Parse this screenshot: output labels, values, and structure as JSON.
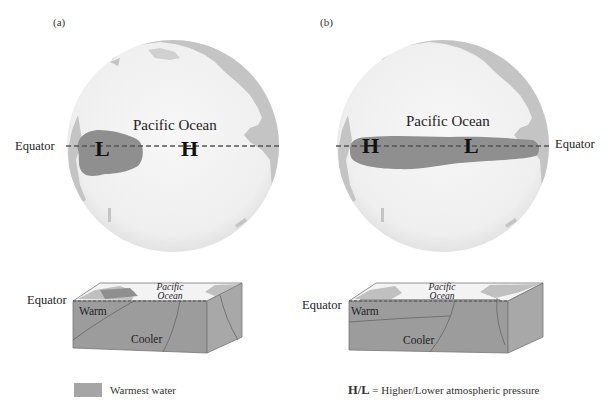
{
  "figure": {
    "panels": [
      {
        "id": "a",
        "label": "(a)",
        "globe": {
          "ocean_label": "Pacific Ocean",
          "equator_label": "Equator",
          "low_label": "L",
          "high_label": "H",
          "warm_pool_position": "western Pacific"
        },
        "block": {
          "equator_label": "Equator",
          "ocean_label_line1": "Pacific",
          "ocean_label_line2": "Ocean",
          "warm_label": "Warm",
          "cool_label": "Cooler"
        }
      },
      {
        "id": "b",
        "label": "(b)",
        "globe": {
          "ocean_label": "Pacific Ocean",
          "equator_label": "Equator",
          "high_label": "H",
          "low_label": "L",
          "warm_pool_position": "spread across equatorial Pacific"
        },
        "block": {
          "equator_label": "Equator",
          "ocean_label_line1": "Pacific",
          "ocean_label_line2": "Ocean",
          "warm_label": "Warm",
          "cool_label": "Cooler"
        }
      }
    ],
    "legend": {
      "swatch_label": "Warmest water",
      "pressure_key_bold": "H/L",
      "pressure_key_text": " = Higher/Lower atmospheric pressure"
    },
    "colors": {
      "ocean": "#f4f4f4",
      "land": "#c4c4c4",
      "warm_water": "#8f8f8f",
      "block_side": "#a0a0a0",
      "block_front": "#989898",
      "equator_line": "#555555"
    }
  }
}
